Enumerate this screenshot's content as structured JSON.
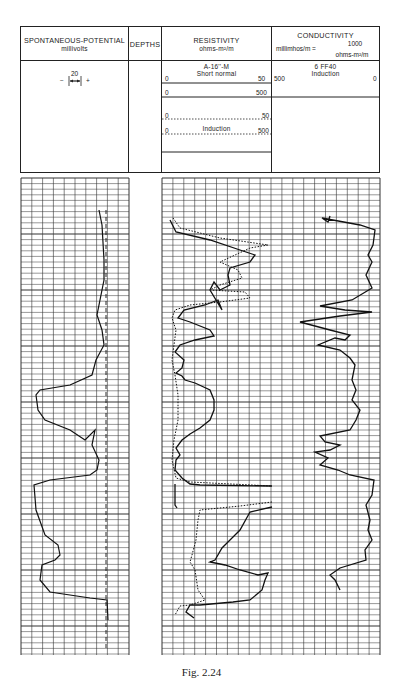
{
  "header": {
    "sp": {
      "title": "SPONTANEOUS-POTENTIAL",
      "unit": "millivolts",
      "scale_value": "20",
      "minus": "−",
      "plus": "+"
    },
    "depths": {
      "title": "DEPTHS"
    },
    "resistivity": {
      "title": "RESISTIVITY",
      "unit": "ohms-m²/m",
      "curve1_name": "A-16''-M",
      "curve1_type": "Short normal",
      "scale1_left": "0",
      "scale1_right": "50",
      "scale2_left": "0",
      "scale2_right": "500",
      "curve2_type": "Induction",
      "scale3_left": "0",
      "scale3_right": "50",
      "scale4_left": "0",
      "scale4_right": "500"
    },
    "conductivity": {
      "title": "CONDUCTIVITY",
      "unit_left": "millimhos/m =",
      "numerator": "1000",
      "denominator": "ohms-m²/m",
      "curve_name": "6 FF40",
      "curve_type": "Induction",
      "scale_left": "500",
      "scale_right": "0"
    }
  },
  "caption": "Fig. 2.24",
  "chart_data": {
    "type": "line",
    "tracks": [
      {
        "name": "Spontaneous-Potential",
        "unit": "millivolts",
        "scale": "20 mV per division",
        "series": [
          {
            "name": "SP curve",
            "style": "solid"
          },
          {
            "name": "Shale baseline",
            "style": "dashed"
          }
        ]
      },
      {
        "name": "Resistivity",
        "unit": "ohms-m²/m",
        "series": [
          {
            "name": "Short normal A-16''-M",
            "scale": [
              0,
              50
            ],
            "style": "solid"
          },
          {
            "name": "Short normal A-16''-M (backup)",
            "scale": [
              0,
              500
            ],
            "style": "solid"
          },
          {
            "name": "Induction",
            "scale": [
              0,
              50
            ],
            "style": "dotted"
          },
          {
            "name": "Induction (backup)",
            "scale": [
              0,
              500
            ],
            "style": "dotted"
          }
        ]
      },
      {
        "name": "Conductivity",
        "unit": "millimhos/m = 1000/(ohms-m²/m)",
        "series": [
          {
            "name": "6 FF40 Induction",
            "scale": [
              500,
              0
            ],
            "style": "solid"
          }
        ]
      }
    ],
    "xlabel": "",
    "ylabel": "Depth",
    "grid": true
  }
}
